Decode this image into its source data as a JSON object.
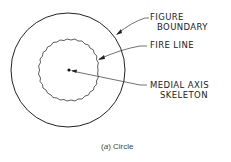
{
  "diagram": {
    "labels": {
      "figure_boundary": [
        "FIGURE",
        "BOUNDARY"
      ],
      "fire_line": "FIRE LINE",
      "medial_axis": [
        "MEDIAL AXIS",
        "SKELETON"
      ]
    },
    "caption": {
      "prefix": "(",
      "letter": "a",
      "suffix": ") Circle"
    },
    "colors": {
      "stroke": "#222222",
      "text": "#222222",
      "caption": "#444444",
      "background": "#ffffff"
    }
  }
}
